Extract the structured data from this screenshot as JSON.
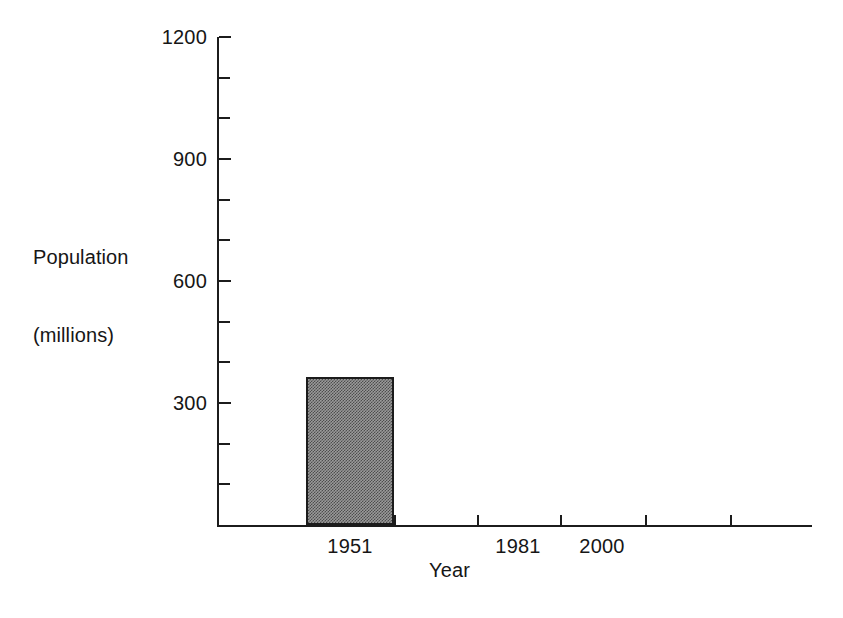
{
  "chart_data": {
    "type": "bar",
    "title": "",
    "xlabel": "Year",
    "ylabel": "Population (millions)",
    "ylabel_line1": "Population",
    "ylabel_line2": "(millions)",
    "categories": [
      "1951",
      "1981",
      "2000"
    ],
    "values": [
      364,
      null,
      null
    ],
    "series": [
      {
        "name": "Population",
        "values": [
          364,
          null,
          null
        ]
      }
    ],
    "ylim": [
      0,
      1200
    ],
    "y_ticks_major": [
      300,
      600,
      900,
      1200
    ],
    "y_tick_labels": [
      "300",
      "600",
      "900",
      "1200"
    ],
    "y_ticks_minor": [
      100,
      200,
      400,
      500,
      700,
      800,
      1000,
      1100
    ],
    "x_tick_labels": [
      "1951",
      "1981",
      "2000"
    ],
    "grid": false,
    "legend": false,
    "legend_position": "none",
    "bar_fill": "#9a9a9a",
    "bar_pattern": "checkerboard-halftone",
    "bar_border_color": "#1c1c1c",
    "axis_color": "#1c1c1c",
    "background_color": "#ffffff"
  },
  "axis": {
    "y_ticks": [
      {
        "value": 1200,
        "label": "1200",
        "major": true
      },
      {
        "value": 1100,
        "label": "",
        "major": false
      },
      {
        "value": 1000,
        "label": "",
        "major": false
      },
      {
        "value": 900,
        "label": "900",
        "major": true
      },
      {
        "value": 800,
        "label": "",
        "major": false
      },
      {
        "value": 700,
        "label": "",
        "major": false
      },
      {
        "value": 600,
        "label": "600",
        "major": true
      },
      {
        "value": 500,
        "label": "",
        "major": false
      },
      {
        "value": 400,
        "label": "",
        "major": false
      },
      {
        "value": 300,
        "label": "300",
        "major": true
      },
      {
        "value": 200,
        "label": "",
        "major": false
      },
      {
        "value": 100,
        "label": "",
        "major": false
      }
    ],
    "x_ticks": [
      {
        "x": 0
      },
      {
        "x": 89
      },
      {
        "x": 177
      },
      {
        "x": 260
      },
      {
        "x": 343
      },
      {
        "x": 428
      },
      {
        "x": 513
      }
    ],
    "x_labels": [
      {
        "label": "1951",
        "x": 133
      },
      {
        "label": "1981",
        "x": 301
      },
      {
        "label": "2000",
        "x": 385
      }
    ]
  },
  "bars": [
    {
      "category": "1951",
      "value": 364,
      "left": 89,
      "width": 88
    }
  ]
}
